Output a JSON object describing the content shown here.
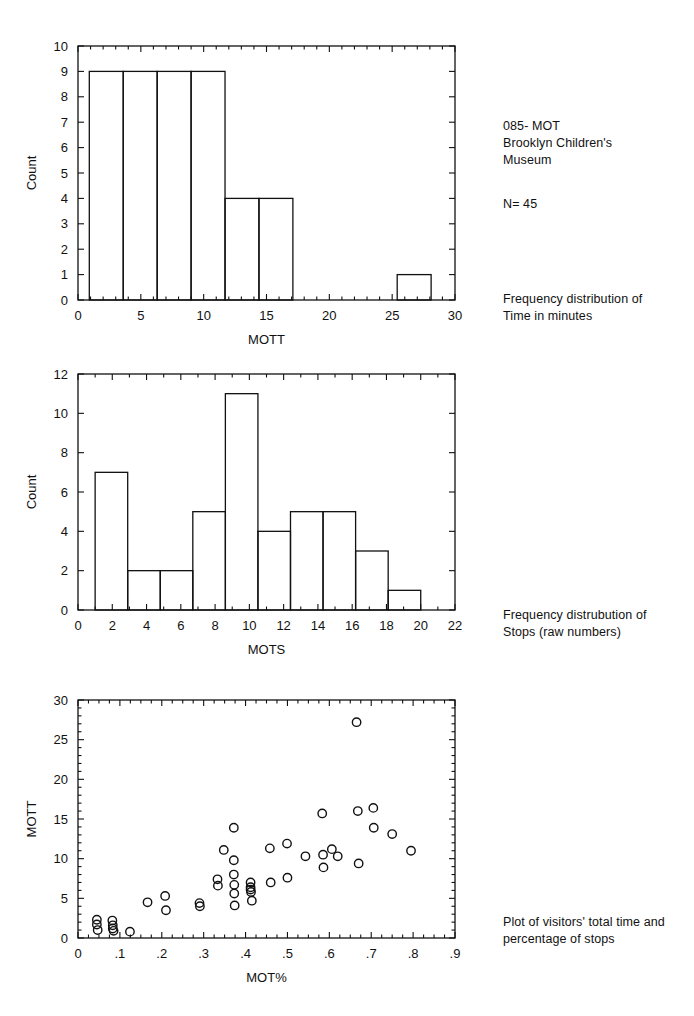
{
  "document": {
    "title": "085- MOT Brooklyn Children's Museum",
    "header_note": "085- MOT\nBrooklyn Children's\nMuseum",
    "n_note": "N= 45"
  },
  "captions": {
    "figure_1": "Frequency distribution of\nTime in minutes",
    "figure_2": "Frequency distrubution of\nStops (raw numbers)",
    "figure_3": "Plot of visitors' total time and\npercentage of stops"
  },
  "colors": {
    "ink": "#111111",
    "background": "#ffffff"
  },
  "chart_data": [
    {
      "id": "figure-1",
      "type": "bar",
      "title": "",
      "xlabel": "MOTT",
      "ylabel": "Count",
      "xlim": [
        0,
        30
      ],
      "ylim": [
        0,
        10
      ],
      "xticks": [
        0,
        5,
        10,
        15,
        20,
        25,
        30
      ],
      "xtick_labels": [
        "0",
        "5",
        "10",
        "15",
        "20",
        "25",
        "30"
      ],
      "xminor_step": 1,
      "yticks": [
        0,
        1,
        2,
        3,
        4,
        5,
        6,
        7,
        8,
        9,
        10
      ],
      "ytick_labels": [
        "0",
        "1",
        "2",
        "3",
        "4",
        "5",
        "6",
        "7",
        "8",
        "9",
        "10"
      ],
      "grid": false,
      "bin_edges": [
        0.9,
        3.6,
        6.3,
        9.0,
        11.7,
        14.4,
        17.1,
        25.4,
        28.1
      ],
      "bins": [
        {
          "x0": 0.9,
          "x1": 3.6,
          "count": 9
        },
        {
          "x0": 3.6,
          "x1": 6.3,
          "count": 9
        },
        {
          "x0": 6.3,
          "x1": 9.0,
          "count": 9
        },
        {
          "x0": 9.0,
          "x1": 11.7,
          "count": 9
        },
        {
          "x0": 11.7,
          "x1": 14.4,
          "count": 4
        },
        {
          "x0": 14.4,
          "x1": 17.1,
          "count": 4
        },
        {
          "x0": 25.4,
          "x1": 28.1,
          "count": 1
        }
      ]
    },
    {
      "id": "figure-2",
      "type": "bar",
      "title": "",
      "xlabel": "MOTS",
      "ylabel": "Count",
      "xlim": [
        0,
        22
      ],
      "ylim": [
        0,
        12
      ],
      "xticks": [
        0,
        2,
        4,
        6,
        8,
        10,
        12,
        14,
        16,
        18,
        20,
        22
      ],
      "xtick_labels": [
        "0",
        "2",
        "4",
        "6",
        "8",
        "10",
        "12",
        "14",
        "16",
        "18",
        "20",
        "22"
      ],
      "xminor_step": 1,
      "yticks": [
        0,
        2,
        4,
        6,
        8,
        10,
        12
      ],
      "ytick_labels": [
        "0",
        "2",
        "4",
        "6",
        "8",
        "10",
        "12"
      ],
      "grid": false,
      "bin_edges": [
        1.0,
        2.9,
        4.8,
        6.7,
        8.6,
        10.5,
        12.4,
        14.3,
        16.2,
        18.1,
        20.0
      ],
      "bins": [
        {
          "x0": 1.0,
          "x1": 2.9,
          "count": 7
        },
        {
          "x0": 2.9,
          "x1": 4.8,
          "count": 2
        },
        {
          "x0": 4.8,
          "x1": 6.7,
          "count": 2
        },
        {
          "x0": 6.7,
          "x1": 8.6,
          "count": 5
        },
        {
          "x0": 8.6,
          "x1": 10.5,
          "count": 11
        },
        {
          "x0": 10.5,
          "x1": 12.4,
          "count": 4
        },
        {
          "x0": 12.4,
          "x1": 14.3,
          "count": 5
        },
        {
          "x0": 14.3,
          "x1": 16.2,
          "count": 5
        },
        {
          "x0": 16.2,
          "x1": 18.1,
          "count": 3
        },
        {
          "x0": 18.1,
          "x1": 20.0,
          "count": 1
        }
      ]
    },
    {
      "id": "figure-3",
      "type": "scatter",
      "title": "",
      "xlabel": "MOT%",
      "ylabel": "MOTT",
      "xlim": [
        0,
        0.9
      ],
      "ylim": [
        0,
        30
      ],
      "xticks": [
        0,
        0.1,
        0.2,
        0.3,
        0.4,
        0.5,
        0.6,
        0.7,
        0.8,
        0.9
      ],
      "xtick_labels": [
        "0",
        ".1",
        ".2",
        ".3",
        ".4",
        ".5",
        ".6",
        ".7",
        ".8",
        ".9"
      ],
      "xminor_step": 0.025,
      "yticks": [
        0,
        5,
        10,
        15,
        20,
        25,
        30
      ],
      "ytick_labels": [
        "0",
        "5",
        "10",
        "15",
        "20",
        "25",
        "30"
      ],
      "yminor_step": 1,
      "grid": false,
      "marker": "open-circle",
      "points": [
        {
          "x": 0.045,
          "y": 2.3
        },
        {
          "x": 0.045,
          "y": 1.7
        },
        {
          "x": 0.047,
          "y": 1.0
        },
        {
          "x": 0.082,
          "y": 2.2
        },
        {
          "x": 0.083,
          "y": 1.6
        },
        {
          "x": 0.083,
          "y": 1.2
        },
        {
          "x": 0.085,
          "y": 0.9
        },
        {
          "x": 0.124,
          "y": 0.8
        },
        {
          "x": 0.166,
          "y": 4.5
        },
        {
          "x": 0.208,
          "y": 5.3
        },
        {
          "x": 0.21,
          "y": 3.5
        },
        {
          "x": 0.29,
          "y": 4.4
        },
        {
          "x": 0.291,
          "y": 4.0
        },
        {
          "x": 0.333,
          "y": 7.4
        },
        {
          "x": 0.334,
          "y": 6.6
        },
        {
          "x": 0.348,
          "y": 11.1
        },
        {
          "x": 0.372,
          "y": 13.9
        },
        {
          "x": 0.372,
          "y": 9.8
        },
        {
          "x": 0.372,
          "y": 8.0
        },
        {
          "x": 0.373,
          "y": 6.7
        },
        {
          "x": 0.373,
          "y": 5.6
        },
        {
          "x": 0.374,
          "y": 4.1
        },
        {
          "x": 0.412,
          "y": 7.0
        },
        {
          "x": 0.412,
          "y": 6.4
        },
        {
          "x": 0.412,
          "y": 6.1
        },
        {
          "x": 0.413,
          "y": 5.8
        },
        {
          "x": 0.415,
          "y": 4.7
        },
        {
          "x": 0.458,
          "y": 11.3
        },
        {
          "x": 0.46,
          "y": 7.0
        },
        {
          "x": 0.499,
          "y": 11.9
        },
        {
          "x": 0.5,
          "y": 7.6
        },
        {
          "x": 0.543,
          "y": 10.3
        },
        {
          "x": 0.583,
          "y": 15.7
        },
        {
          "x": 0.585,
          "y": 10.5
        },
        {
          "x": 0.586,
          "y": 8.9
        },
        {
          "x": 0.606,
          "y": 11.2
        },
        {
          "x": 0.62,
          "y": 10.3
        },
        {
          "x": 0.665,
          "y": 27.2
        },
        {
          "x": 0.668,
          "y": 16.0
        },
        {
          "x": 0.67,
          "y": 9.4
        },
        {
          "x": 0.705,
          "y": 16.4
        },
        {
          "x": 0.706,
          "y": 13.9
        },
        {
          "x": 0.75,
          "y": 13.1
        },
        {
          "x": 0.795,
          "y": 11.0
        }
      ]
    }
  ]
}
